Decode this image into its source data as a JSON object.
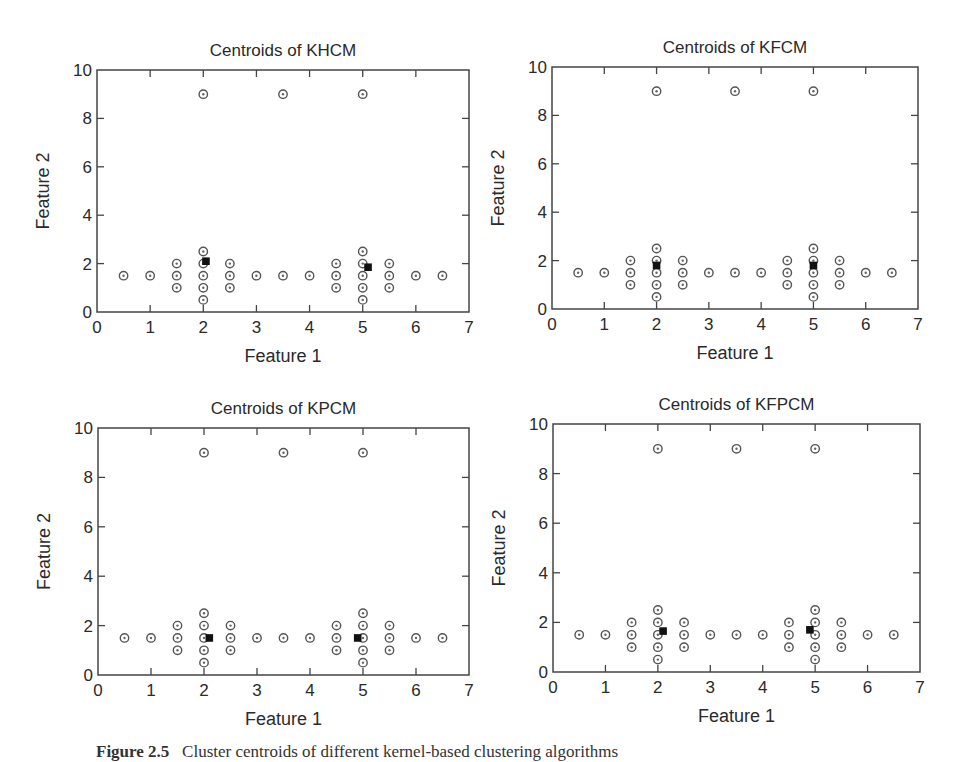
{
  "figure": {
    "caption_label": "Figure 2.5",
    "caption_text": "Cluster centroids of different kernel-based clustering algorithms"
  },
  "chart_data": [
    {
      "type": "scatter",
      "title": "Centroids of KHCM",
      "xlabel": "Feature 1",
      "ylabel": "Feature 2",
      "xlim": [
        0,
        7
      ],
      "ylim": [
        0,
        10
      ],
      "xticks": [
        0,
        1,
        2,
        3,
        4,
        5,
        6,
        7
      ],
      "yticks": [
        0,
        2,
        4,
        6,
        8,
        10
      ],
      "grid": false,
      "legend": null,
      "series": [
        {
          "name": "data points",
          "marker": "circle-dot",
          "points": "shared"
        },
        {
          "name": "centroids",
          "marker": "filled-square",
          "points": [
            [
              2.05,
              2.1
            ],
            [
              5.1,
              1.85
            ]
          ]
        }
      ]
    },
    {
      "type": "scatter",
      "title": "Centroids of KFCM",
      "xlabel": "Feature 1",
      "ylabel": "Feature 2",
      "xlim": [
        0,
        7
      ],
      "ylim": [
        0,
        10
      ],
      "xticks": [
        0,
        1,
        2,
        3,
        4,
        5,
        6,
        7
      ],
      "yticks": [
        0,
        2,
        4,
        6,
        8,
        10
      ],
      "grid": false,
      "legend": null,
      "series": [
        {
          "name": "data points",
          "marker": "circle-dot",
          "points": "shared"
        },
        {
          "name": "centroids",
          "marker": "filled-square",
          "points": [
            [
              2.0,
              1.8
            ],
            [
              5.0,
              1.8
            ]
          ]
        }
      ]
    },
    {
      "type": "scatter",
      "title": "Centroids of KPCM",
      "xlabel": "Feature 1",
      "ylabel": "Feature 2",
      "xlim": [
        0,
        7
      ],
      "ylim": [
        0,
        10
      ],
      "xticks": [
        0,
        1,
        2,
        3,
        4,
        5,
        6,
        7
      ],
      "yticks": [
        0,
        2,
        4,
        6,
        8,
        10
      ],
      "grid": false,
      "legend": null,
      "series": [
        {
          "name": "data points",
          "marker": "circle-dot",
          "points": "shared"
        },
        {
          "name": "centroids",
          "marker": "filled-square",
          "points": [
            [
              2.1,
              1.5
            ],
            [
              4.9,
              1.5
            ]
          ]
        }
      ]
    },
    {
      "type": "scatter",
      "title": "Centroids of KFPCM",
      "xlabel": "Feature 1",
      "ylabel": "Feature 2",
      "xlim": [
        0,
        7
      ],
      "ylim": [
        0,
        10
      ],
      "xticks": [
        0,
        1,
        2,
        3,
        4,
        5,
        6,
        7
      ],
      "yticks": [
        0,
        2,
        4,
        6,
        8,
        10
      ],
      "grid": false,
      "legend": null,
      "series": [
        {
          "name": "data points",
          "marker": "circle-dot",
          "points": "shared"
        },
        {
          "name": "centroids",
          "marker": "filled-square",
          "points": [
            [
              2.1,
              1.65
            ],
            [
              4.9,
              1.7
            ]
          ]
        }
      ]
    }
  ],
  "shared_data_points": [
    [
      0.5,
      1.5
    ],
    [
      1.0,
      1.5
    ],
    [
      1.5,
      1.0
    ],
    [
      1.5,
      1.5
    ],
    [
      1.5,
      2.0
    ],
    [
      2.0,
      0.5
    ],
    [
      2.0,
      1.0
    ],
    [
      2.0,
      1.5
    ],
    [
      2.0,
      2.0
    ],
    [
      2.0,
      2.5
    ],
    [
      2.5,
      1.0
    ],
    [
      2.5,
      1.5
    ],
    [
      2.5,
      2.0
    ],
    [
      3.0,
      1.5
    ],
    [
      3.5,
      1.5
    ],
    [
      4.0,
      1.5
    ],
    [
      4.5,
      1.0
    ],
    [
      4.5,
      1.5
    ],
    [
      4.5,
      2.0
    ],
    [
      5.0,
      0.5
    ],
    [
      5.0,
      1.0
    ],
    [
      5.0,
      1.5
    ],
    [
      5.0,
      2.0
    ],
    [
      5.0,
      2.5
    ],
    [
      5.5,
      1.0
    ],
    [
      5.5,
      1.5
    ],
    [
      5.5,
      2.0
    ],
    [
      6.0,
      1.5
    ],
    [
      6.5,
      1.5
    ],
    [
      2.0,
      9.0
    ],
    [
      3.5,
      9.0
    ],
    [
      5.0,
      9.0
    ]
  ]
}
